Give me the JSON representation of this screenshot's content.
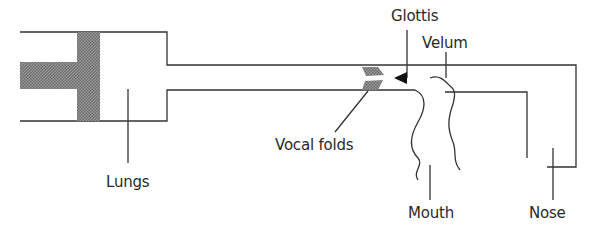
{
  "diagram": {
    "title": "",
    "type": "speech production model",
    "labels": {
      "glottis": "Glottis",
      "velum": "Velum",
      "vocal_folds": "Vocal folds",
      "lungs": "Lungs",
      "mouth": "Mouth",
      "nose": "Nose"
    },
    "colors": {
      "line": "#333333",
      "shading": "#8a8a8a",
      "background": "#ffffff"
    }
  }
}
